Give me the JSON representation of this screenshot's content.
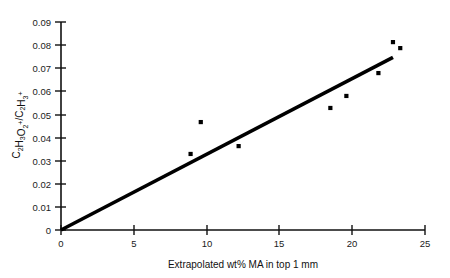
{
  "chart_data": {
    "type": "scatter",
    "title": "",
    "xlabel": "Extrapolated wt% MA in top 1 mm",
    "ylabel": "C2H3O2+/C2H3+",
    "ylabel_parts": [
      {
        "text": "C",
        "style": "normal"
      },
      {
        "text": "2",
        "style": "sub"
      },
      {
        "text": "H",
        "style": "normal"
      },
      {
        "text": "3",
        "style": "sub"
      },
      {
        "text": "O",
        "style": "normal"
      },
      {
        "text": "2",
        "style": "sub"
      },
      {
        "text": "+",
        "style": "sup"
      },
      {
        "text": "/C",
        "style": "normal"
      },
      {
        "text": "2",
        "style": "sub"
      },
      {
        "text": "H",
        "style": "normal"
      },
      {
        "text": "3",
        "style": "sub"
      },
      {
        "text": "+",
        "style": "sup"
      }
    ],
    "xlim": [
      0,
      25
    ],
    "ylim": [
      0,
      0.09
    ],
    "xticks": [
      0,
      5,
      10,
      15,
      20,
      25
    ],
    "xtick_labels": [
      "0",
      "5",
      "10",
      "15",
      "20",
      "25"
    ],
    "yticks": [
      0,
      0.01,
      0.02,
      0.03,
      0.04,
      0.05,
      0.06,
      0.07,
      0.08,
      0.09
    ],
    "ytick_labels": [
      "0",
      "0.01",
      "0.02",
      "0.03",
      "0.04",
      "0.05",
      "0.06",
      "0.07",
      "0.08",
      "0.09"
    ],
    "grid": false,
    "legend": false,
    "legend_position": "none",
    "marker_color": "#000000",
    "line_color": "#000000",
    "axis_color": "#111111",
    "points": [
      {
        "x": 8.9,
        "y": 0.0329
      },
      {
        "x": 9.6,
        "y": 0.0467
      },
      {
        "x": 12.2,
        "y": 0.0363
      },
      {
        "x": 18.5,
        "y": 0.0528
      },
      {
        "x": 19.6,
        "y": 0.058
      },
      {
        "x": 21.8,
        "y": 0.0679
      },
      {
        "x": 22.8,
        "y": 0.0813
      },
      {
        "x": 23.3,
        "y": 0.0787
      }
    ],
    "fit_line": {
      "x_start": 0.0,
      "y_start": 0.0,
      "x_end": 22.8,
      "y_end": 0.0747,
      "slope": 0.003276,
      "intercept": 0.0
    }
  }
}
